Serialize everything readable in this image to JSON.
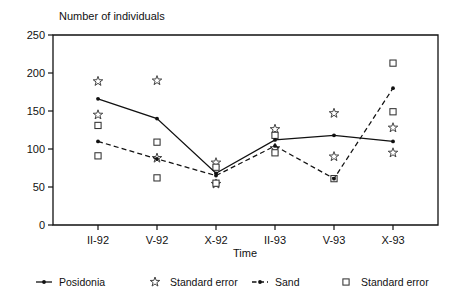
{
  "chart_data": {
    "type": "line",
    "title": "Number of individuals",
    "xlabel": "Time",
    "ylabel": "Number of individuals",
    "categories": [
      "II-92",
      "V-92",
      "X-92",
      "II-93",
      "V-93",
      "X-93"
    ],
    "ylim": [
      0,
      250
    ],
    "yticks": [
      0,
      50,
      100,
      150,
      200,
      250
    ],
    "ytick_labels": [
      "0",
      "50",
      "100",
      "150",
      "200",
      "250"
    ],
    "grid": false,
    "legend_position": "bottom",
    "series": [
      {
        "name": "Posidonia",
        "marker": "filled-dot",
        "line": "solid",
        "values": [
          166,
          140,
          68,
          112,
          118,
          110
        ]
      },
      {
        "name": "Standard error",
        "marker": "star",
        "line": "none",
        "for_series": "Posidonia",
        "upper": [
          189,
          190,
          82,
          126,
          147,
          128
        ],
        "lower": [
          145,
          88,
          54,
          101,
          90,
          95
        ]
      },
      {
        "name": "Sand",
        "marker": "filled-dot",
        "line": "dashed",
        "values": [
          110,
          87,
          65,
          104,
          61,
          180
        ]
      },
      {
        "name": "Standard error",
        "marker": "square",
        "line": "none",
        "for_series": "Sand",
        "upper": [
          131,
          109,
          76,
          118,
          61,
          213
        ],
        "lower": [
          91,
          62,
          55,
          95,
          61,
          149
        ]
      }
    ]
  },
  "legend": {
    "entries": [
      {
        "label": "Posidonia",
        "marker": "line-dot"
      },
      {
        "label": "Standard error",
        "marker": "star"
      },
      {
        "label": "Sand",
        "marker": "line-dashed-dot"
      },
      {
        "label": "Standard error",
        "marker": "square"
      }
    ]
  },
  "axes": {
    "y_title": "Number of individuals",
    "x_title": "Time"
  }
}
